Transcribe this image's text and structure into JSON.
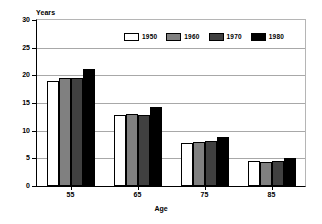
{
  "chart_data": {
    "type": "bar",
    "title": "",
    "subtitle": "",
    "xlabel": "Age",
    "ylabel": "Years",
    "categories": [
      "55",
      "65",
      "75",
      "85"
    ],
    "series": [
      {
        "name": "1950",
        "color": "#ffffff",
        "values": [
          19.0,
          12.8,
          7.8,
          4.5
        ]
      },
      {
        "name": "1960",
        "color": "#808080",
        "values": [
          19.5,
          13.0,
          8.0,
          4.3
        ]
      },
      {
        "name": "1970",
        "color": "#404040",
        "values": [
          19.5,
          12.9,
          8.2,
          4.6
        ]
      },
      {
        "name": "1980",
        "color": "#000000",
        "values": [
          21.2,
          14.2,
          8.8,
          5.0
        ]
      }
    ],
    "ylim": [
      0,
      30
    ],
    "ytick_labels": [
      "0",
      "5",
      "10",
      "15",
      "20",
      "25",
      "30"
    ],
    "ytick_values": [
      0,
      5,
      10,
      15,
      20,
      25,
      30
    ],
    "grid": true,
    "legend_position": "top-right-inside"
  },
  "axes": {
    "y_title": "Years",
    "x_title": "Age"
  },
  "legend": {
    "entries": [
      {
        "label": "1950",
        "swatch": "legend-swatch-1950"
      },
      {
        "label": "1960",
        "swatch": "legend-swatch-1960"
      },
      {
        "label": "1970",
        "swatch": "legend-swatch-1970"
      },
      {
        "label": "1980",
        "swatch": "legend-swatch-1980"
      }
    ]
  }
}
